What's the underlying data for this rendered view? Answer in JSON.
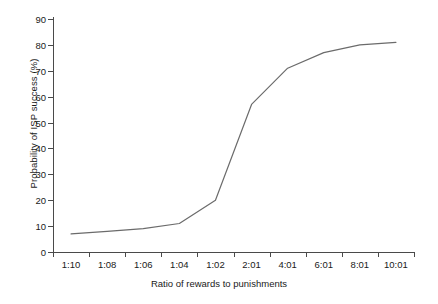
{
  "chart_data": {
    "type": "line",
    "title": "",
    "xlabel": "Ratio of rewards to punishments",
    "ylabel": "Probability of ISP success (%)",
    "categories": [
      "1:10",
      "1:08",
      "1:06",
      "1:04",
      "1:02",
      "2:01",
      "4:01",
      "6:01",
      "8:01",
      "10:01"
    ],
    "values": [
      7,
      8,
      9,
      11,
      20,
      57,
      71,
      77,
      80,
      81
    ],
    "series": [
      {
        "name": "Probability of ISP success",
        "values": [
          7,
          8,
          9,
          11,
          20,
          57,
          71,
          77,
          80,
          81
        ]
      }
    ],
    "ylim": [
      0,
      90
    ],
    "yticks": [
      0,
      10,
      20,
      30,
      40,
      50,
      60,
      70,
      80,
      90
    ],
    "ytick_labels": [
      "0",
      "10",
      "20",
      "30",
      "40",
      "50",
      "60",
      "70",
      "80",
      "90"
    ],
    "xtick_labels": [
      "1:10",
      "1:08",
      "1:06",
      "1:04",
      "1:02",
      "2:01",
      "4:01",
      "6:01",
      "8:01",
      "10:01"
    ],
    "grid": false,
    "legend": null,
    "line_color": "#6b6b6b",
    "axis_color": "#4a4a4a",
    "background": "#ffffff",
    "annotations": []
  }
}
